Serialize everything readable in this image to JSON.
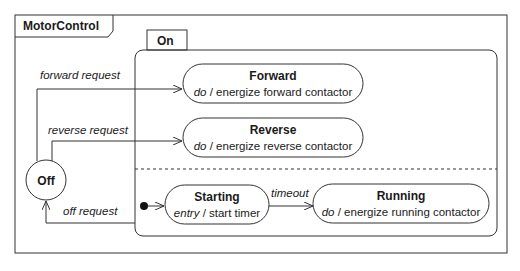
{
  "diagram": {
    "frame": {
      "title": "MotorControl"
    },
    "composite_state": {
      "name": "On"
    },
    "states": {
      "off": {
        "name": "Off"
      },
      "forward": {
        "name": "Forward",
        "activity_keyword": "do",
        "activity": " / energize forward contactor"
      },
      "reverse": {
        "name": "Reverse",
        "activity_keyword": "do",
        "activity": " / energize reverse contactor"
      },
      "starting": {
        "name": "Starting",
        "activity_keyword": "entry",
        "activity": " / start timer"
      },
      "running": {
        "name": "Running",
        "activity_keyword": "do",
        "activity": " / energize running contactor"
      }
    },
    "transitions": {
      "forward_request": "forward request",
      "reverse_request": "reverse request",
      "off_request": "off request",
      "timeout": "timeout"
    }
  }
}
